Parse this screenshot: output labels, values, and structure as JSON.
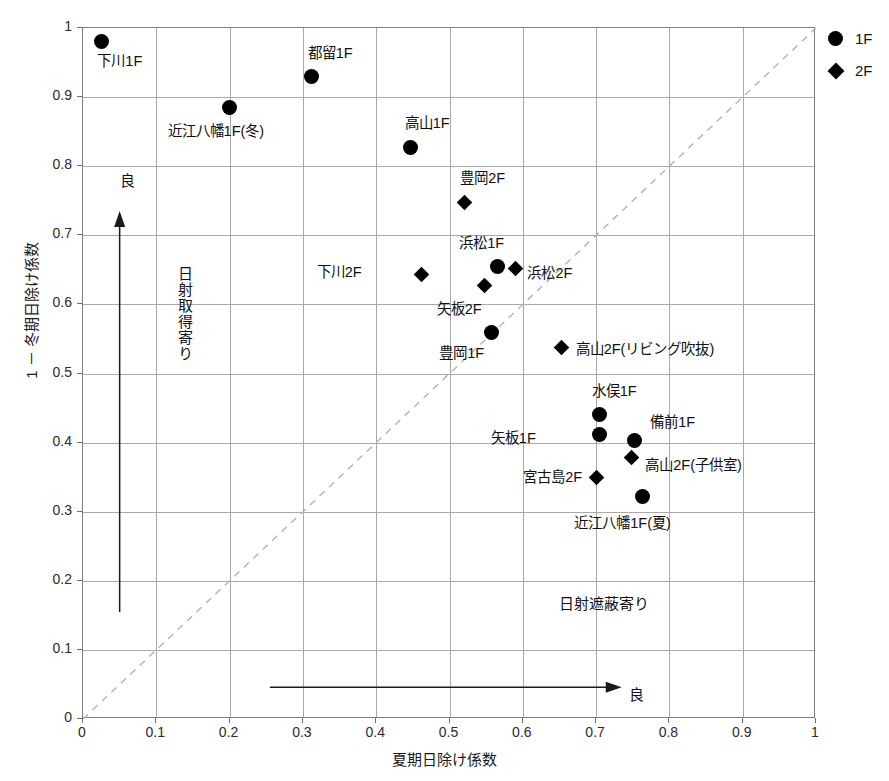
{
  "chart_data": {
    "type": "scatter",
    "title": "",
    "xlabel": "夏期日除け係数",
    "ylabel": "1 － 冬期日除け係数",
    "xlim": [
      0,
      1
    ],
    "ylim": [
      0,
      1
    ],
    "grid": true,
    "xticks": [
      "0",
      "0.1",
      "0.2",
      "0.3",
      "0.4",
      "0.5",
      "0.6",
      "0.7",
      "0.8",
      "0.9",
      "1"
    ],
    "yticks": [
      "0",
      "0.1",
      "0.2",
      "0.3",
      "0.4",
      "0.5",
      "0.6",
      "0.7",
      "0.8",
      "0.9",
      "1"
    ],
    "legend_position": "outside-top-right",
    "reference_line": {
      "style": "dashed",
      "from": [
        0,
        0
      ],
      "to": [
        1,
        1
      ],
      "color": "#b3b3b3"
    },
    "series": [
      {
        "name": "1F",
        "marker": "circle",
        "color": "#000000",
        "points": [
          {
            "label": "下川1F",
            "x": 0.025,
            "y": 0.98,
            "label_dx": -4,
            "label_dy": 20,
            "anchor": "left"
          },
          {
            "label": "近江八幡1F(冬)",
            "x": 0.2,
            "y": 0.885,
            "label_dx": -62,
            "label_dy": 25,
            "anchor": "left"
          },
          {
            "label": "都留1F",
            "x": 0.312,
            "y": 0.93,
            "label_dx": -4,
            "label_dy": -22,
            "anchor": "left"
          },
          {
            "label": "高山1F",
            "x": 0.447,
            "y": 0.827,
            "label_dx": -6,
            "label_dy": -24,
            "anchor": "left"
          },
          {
            "label": "浜松1F",
            "x": 0.565,
            "y": 0.655,
            "label_dx": -38,
            "label_dy": -22,
            "anchor": "left"
          },
          {
            "label": "豊岡1F",
            "x": 0.557,
            "y": 0.56,
            "label_dx": -52,
            "label_dy": 22,
            "anchor": "left"
          },
          {
            "label": "水俣1F",
            "x": 0.705,
            "y": 0.44,
            "label_dx": -8,
            "label_dy": -23,
            "anchor": "left"
          },
          {
            "label": "矢板1F",
            "x": 0.705,
            "y": 0.412,
            "label_dx": -62,
            "label_dy": 5,
            "anchor": "right"
          },
          {
            "label": "備前1F",
            "x": 0.752,
            "y": 0.403,
            "label_dx": 16,
            "label_dy": -18,
            "anchor": "left"
          },
          {
            "label": "近江八幡1F(夏)",
            "x": 0.763,
            "y": 0.322,
            "label_dx": -68,
            "label_dy": 28,
            "anchor": "left"
          }
        ]
      },
      {
        "name": "2F",
        "marker": "diamond",
        "color": "#000000",
        "points": [
          {
            "label": "豊岡2F",
            "x": 0.52,
            "y": 0.748,
            "label_dx": -4,
            "label_dy": -23,
            "anchor": "left"
          },
          {
            "label": "下川2F",
            "x": 0.462,
            "y": 0.643,
            "label_dx": -58,
            "label_dy": -2,
            "anchor": "right"
          },
          {
            "label": "矢板2F",
            "x": 0.548,
            "y": 0.627,
            "label_dx": -48,
            "label_dy": 24,
            "anchor": "left"
          },
          {
            "label": "浜松2F",
            "x": 0.59,
            "y": 0.652,
            "label_dx": 12,
            "label_dy": 6,
            "anchor": "left"
          },
          {
            "label": "高山2F(リビング吹抜)",
            "x": 0.653,
            "y": 0.537,
            "label_dx": 14,
            "label_dy": 2,
            "anchor": "left"
          },
          {
            "label": "高山2F(子供室)",
            "x": 0.748,
            "y": 0.378,
            "label_dx": 14,
            "label_dy": 8,
            "anchor": "left"
          },
          {
            "label": "宮古島2F",
            "x": 0.7,
            "y": 0.35,
            "label_dx": -12,
            "label_dy": 1,
            "anchor": "right"
          }
        ]
      }
    ],
    "annotations": [
      {
        "name": "good-up",
        "text": "良",
        "x": 0.05,
        "y": 0.79,
        "orientation": "horizontal"
      },
      {
        "name": "good-right",
        "text": "良",
        "x": 0.745,
        "y": 0.046,
        "orientation": "horizontal"
      },
      {
        "name": "solar-gain",
        "text": "日射取得寄り",
        "x": 0.128,
        "y": 0.655,
        "orientation": "vertical"
      },
      {
        "name": "solar-shade",
        "text": "日射遮蔽寄り",
        "x": 0.65,
        "y": 0.178,
        "orientation": "horizontal"
      }
    ],
    "arrows": [
      {
        "name": "up-arrow",
        "direction": "up",
        "x": 0.05,
        "y_from": 0.155,
        "y_to": 0.735
      },
      {
        "name": "right-arrow",
        "direction": "right",
        "y": 0.046,
        "x_from": 0.255,
        "x_to": 0.735
      }
    ]
  },
  "legend": {
    "items": [
      {
        "label": "1F",
        "marker": "circle"
      },
      {
        "label": "2F",
        "marker": "diamond"
      }
    ]
  }
}
